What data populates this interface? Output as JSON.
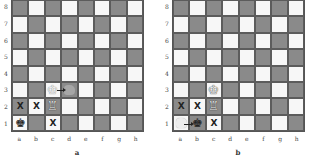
{
  "files": [
    "a",
    "b",
    "c",
    "d",
    "e",
    "f",
    "g",
    "h"
  ],
  "ranks": [
    "8",
    "7",
    "6",
    "5",
    "4",
    "3",
    "2",
    "1"
  ],
  "diagrams": [
    {
      "caption": "a",
      "pieces": [
        {
          "square": "c3",
          "piece": "king",
          "color": "white",
          "glyph": "♔",
          "ghost": true
        },
        {
          "square": "c2",
          "piece": "rook",
          "color": "white",
          "glyph": "♖"
        },
        {
          "square": "a1",
          "piece": "king",
          "color": "black",
          "glyph": "♚"
        }
      ],
      "ghost_target": {
        "square": "d3"
      },
      "arrow": {
        "from": "c3",
        "to": "d3"
      },
      "marks": [
        {
          "square": "a2",
          "symbol": "X"
        },
        {
          "square": "b2",
          "symbol": "X"
        },
        {
          "square": "c1",
          "symbol": "X"
        }
      ]
    },
    {
      "caption": "b",
      "pieces": [
        {
          "square": "c3",
          "piece": "king",
          "color": "white",
          "glyph": "♔"
        },
        {
          "square": "c2",
          "piece": "rook",
          "color": "white",
          "glyph": "♖"
        },
        {
          "square": "b1",
          "piece": "king",
          "color": "black",
          "glyph": "♚"
        }
      ],
      "ghost_origin": {
        "square": "a1"
      },
      "arrow": {
        "from": "a1",
        "to": "b1"
      },
      "marks": [
        {
          "square": "a2",
          "symbol": "X"
        },
        {
          "square": "b2",
          "symbol": "X"
        },
        {
          "square": "c1",
          "symbol": "X"
        }
      ]
    }
  ],
  "colors": {
    "light_square": "#f7f7f7",
    "dark_square": "#8a8a8a"
  }
}
